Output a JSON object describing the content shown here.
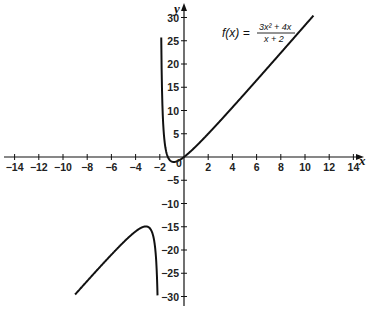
{
  "chart_data": {
    "type": "line",
    "title": "",
    "function_label": "f(x) = (3x^2 + 4x) / (x + 2)",
    "formula": {
      "lhs": "f(x) =",
      "numerator": "3x² + 4x",
      "denominator": "x + 2"
    },
    "xlabel": "x",
    "ylabel": "y",
    "xlim": [
      -15,
      15
    ],
    "ylim": [
      -32,
      32
    ],
    "x_ticks": [
      -14,
      -12,
      -10,
      -8,
      -6,
      -4,
      -2,
      0,
      2,
      4,
      6,
      8,
      10,
      12,
      14
    ],
    "x_tick_labels": [
      "−14",
      "−12",
      "−10",
      "−8",
      "−6",
      "−4",
      "−2",
      "0",
      "2",
      "4",
      "6",
      "8",
      "10",
      "12",
      "14"
    ],
    "y_ticks": [
      -30,
      -25,
      -20,
      -15,
      -10,
      -5,
      5,
      10,
      15,
      20,
      25,
      30
    ],
    "y_tick_labels": [
      "−30",
      "−25",
      "−20",
      "−15",
      "−10",
      "−5",
      "5",
      "10",
      "15",
      "20",
      "25",
      "30"
    ],
    "grid": false,
    "legend": null,
    "vertical_asymptote": -2,
    "oblique_asymptote": "y = 3x − 2",
    "series": [
      {
        "name": "f(x) right branch (x > -2)",
        "x": [
          -1.88,
          -1.8,
          -1.7,
          -1.6,
          -1.5,
          -1.4,
          -1.33,
          -1.2,
          -1.0,
          -0.8,
          -0.6,
          -0.4,
          -0.2,
          0,
          0.5,
          1,
          2,
          3,
          4,
          5,
          6,
          7,
          8,
          9,
          10,
          10.7
        ],
        "y": [
          30,
          19.8,
          12.1,
          7.6,
          4.5,
          2.9,
          0,
          -1.8,
          -1.0,
          -0.27,
          0.09,
          0.2,
          0.22,
          0,
          1.4,
          2.33,
          5,
          7.8,
          10.67,
          13.57,
          16.5,
          19.44,
          22.4,
          25.36,
          28.33,
          30.4
        ],
        "color": "#111111"
      },
      {
        "name": "f(x) left branch (x < -2)",
        "x": [
          -9,
          -8,
          -7,
          -6,
          -5,
          -4,
          -3.5,
          -3.15,
          -3,
          -2.8,
          -2.6,
          -2.4,
          -2.25,
          -2.12
        ],
        "y": [
          -29.6,
          -26.7,
          -23.8,
          -21,
          -18.3,
          -16,
          -15.2,
          -15.0,
          -15.0,
          -15.4,
          -16.9,
          -20.4,
          -24.8,
          -30
        ],
        "color": "#111111"
      }
    ],
    "annotations": [
      {
        "text": "0",
        "x": -0.3,
        "y": -1,
        "note": "origin label"
      }
    ]
  }
}
